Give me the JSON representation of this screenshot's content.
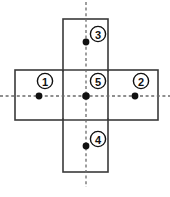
{
  "figure": {
    "title": "",
    "canvas": {
      "width": 170,
      "height": 197
    },
    "colors": {
      "background": "#ffffff",
      "rect_stroke": "#3a3a3a",
      "rect_fill": "#ffffff",
      "axis_stroke": "#6b6b6b",
      "dot_fill": "#111111",
      "label_stroke": "#111111",
      "label_fill": "#ffffff",
      "label_text": "#111111"
    },
    "rectangles": [
      {
        "name": "horizontal-rectangle",
        "x": 15,
        "y": 70,
        "width": 143,
        "height": 50
      },
      {
        "name": "vertical-rectangle",
        "x": 63,
        "y": 19,
        "width": 45,
        "height": 153
      }
    ],
    "axes": [
      {
        "name": "horizontal-axis",
        "orientation": "horizontal",
        "x1": 0,
        "y1": 96,
        "x2": 170,
        "y2": 96,
        "style": "dashed"
      },
      {
        "name": "vertical-axis",
        "orientation": "vertical",
        "x1": 86,
        "y1": 2,
        "x2": 86,
        "y2": 187,
        "style": "dashed"
      }
    ],
    "points": [
      {
        "id": "point-1",
        "label": "1",
        "dot_x": 39,
        "dot_y": 96,
        "dot_r": 3.4,
        "label_x": 45,
        "label_y": 81,
        "label_r": 7.6
      },
      {
        "id": "point-2",
        "label": "2",
        "dot_x": 135,
        "dot_y": 96,
        "dot_r": 3.4,
        "label_x": 141,
        "label_y": 81,
        "label_r": 7.6
      },
      {
        "id": "point-3",
        "label": "3",
        "dot_x": 86,
        "dot_y": 42,
        "dot_r": 3.4,
        "label_x": 98,
        "label_y": 34,
        "label_r": 7.6
      },
      {
        "id": "point-4",
        "label": "4",
        "dot_x": 86,
        "dot_y": 146,
        "dot_r": 3.4,
        "label_x": 98,
        "label_y": 139,
        "label_r": 7.6
      },
      {
        "id": "point-5",
        "label": "5",
        "dot_x": 86,
        "dot_y": 96,
        "dot_r": 3.8,
        "label_x": 98,
        "label_y": 81,
        "label_r": 7.6
      }
    ]
  }
}
